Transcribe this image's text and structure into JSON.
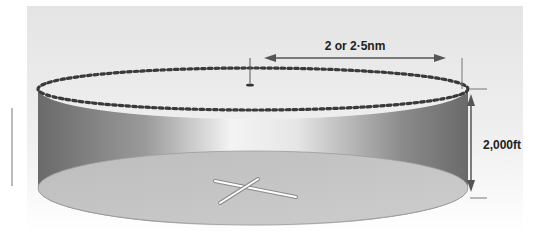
{
  "diagram": {
    "radius_label": "2 or 2·5nm",
    "height_label": "2,000ft",
    "colors": {
      "panel_top": "#e6e6e6",
      "panel_bottom": "#ffffff",
      "wall_dark": "#6e6e6e",
      "wall_light": "#f2f2f2",
      "base_fill": "#c4c4c4",
      "dots": "#3a3a3a",
      "arrow": "#555555"
    }
  }
}
